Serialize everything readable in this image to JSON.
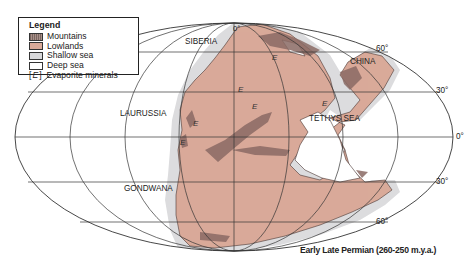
{
  "legend": {
    "title": "Legend",
    "items": [
      {
        "key": "mountains",
        "label": "Mountains",
        "color": "#8a7470"
      },
      {
        "key": "lowlands",
        "label": "Lowlands",
        "color": "#d9aa99"
      },
      {
        "key": "shallow_sea",
        "label": "Shallow sea",
        "color": "#d8d8da"
      },
      {
        "key": "deep_sea",
        "label": "Deep sea",
        "color": "#ffffff"
      },
      {
        "key": "evaporite",
        "label": "Evaporite minerals",
        "symbol": "[E]"
      }
    ]
  },
  "regions": {
    "siberia": "SIBERIA",
    "china": "CHINA",
    "laurussia": "LAURUSSIA",
    "tethys": "TETHYS SEA",
    "gondwana": "GONDWANA"
  },
  "latitude_labels": {
    "n90": "0°",
    "n60": "60°",
    "n30": "30°",
    "eq": "0°",
    "s30": "30°",
    "s60": "60°"
  },
  "evaporite_marker": "E",
  "caption": "Early Late Permian (260-250 m.y.a.)",
  "colors": {
    "lowland": "#d9aa99",
    "mountain": "#8a6a64",
    "shallow": "#dcdcde",
    "grid": "#333333"
  }
}
